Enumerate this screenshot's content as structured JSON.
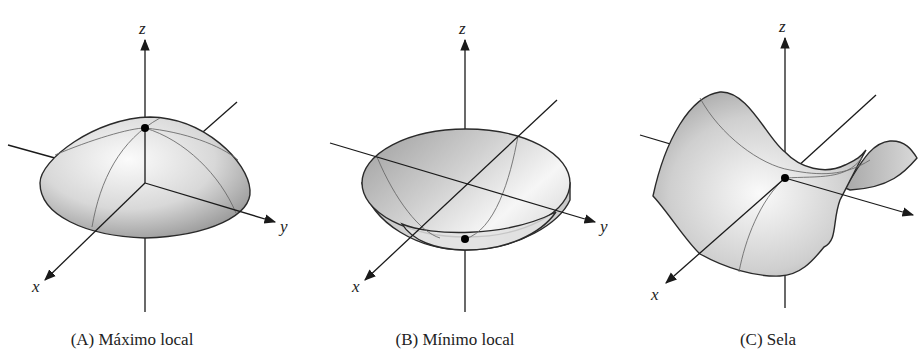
{
  "figure": {
    "panels": [
      {
        "id": "A",
        "caption": "(A) Máximo local",
        "surface": "dome",
        "axis_labels": {
          "x": "x",
          "y": "y",
          "z": "z"
        },
        "critical_point": "local maximum"
      },
      {
        "id": "B",
        "caption": "(B) Mínimo local",
        "surface": "bowl",
        "axis_labels": {
          "x": "x",
          "y": "y",
          "z": "z"
        },
        "critical_point": "local minimum"
      },
      {
        "id": "C",
        "caption": "(C) Sela",
        "surface": "saddle",
        "axis_labels": {
          "x": "x",
          "y": "",
          "z": "z"
        },
        "critical_point": "saddle point"
      }
    ],
    "colors": {
      "axis": "#1a1a1a",
      "surface_light": "#f4f4f4",
      "surface_dark": "#9a9a9a",
      "point": "#000000"
    }
  }
}
